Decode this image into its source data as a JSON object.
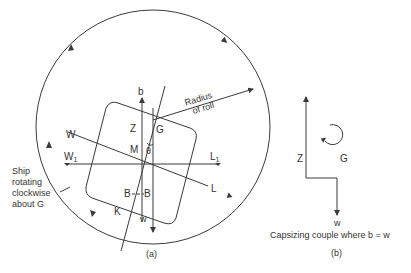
{
  "diagram": {
    "panel_a": {
      "caption": "(a)",
      "labels": {
        "b": "b",
        "radius": "Radius",
        "of_roll": "of roll",
        "Z": "Z",
        "G": "G",
        "M": "M",
        "theta": "θ",
        "W": "W",
        "W1": "W",
        "W1_sub": "1",
        "L1": "L",
        "L1_sub": "1",
        "L": "L",
        "B_left": "B",
        "B_right": "B",
        "K": "K",
        "w": "w"
      },
      "annotation": [
        "Ship",
        "rotating",
        "clockwise",
        "about G"
      ]
    },
    "panel_b": {
      "caption": "(b)",
      "labels": {
        "Z": "Z",
        "G": "G",
        "w": "w"
      },
      "description": "Capsizing couple where b = w"
    },
    "colors": {
      "line": "#3a3a3a",
      "text": "#333333",
      "background": "#ffffff"
    }
  }
}
